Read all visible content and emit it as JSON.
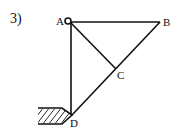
{
  "problem_number": "3)",
  "points": {
    "A": {
      "label": "A",
      "x": 68,
      "y": 21
    },
    "B": {
      "label": "B",
      "x": 160,
      "y": 21
    },
    "C": {
      "label": "C",
      "x": 117,
      "y": 68
    },
    "D": {
      "label": "D",
      "x": 72,
      "y": 115
    }
  },
  "members": [
    "AB",
    "AD",
    "BD",
    "AC"
  ],
  "support": {
    "type": "fixed-wall",
    "at": "D",
    "hatch": true
  },
  "pin": {
    "at": "A",
    "type": "hinge"
  },
  "colors": {
    "line": "#111111",
    "background": "#ffffff"
  }
}
